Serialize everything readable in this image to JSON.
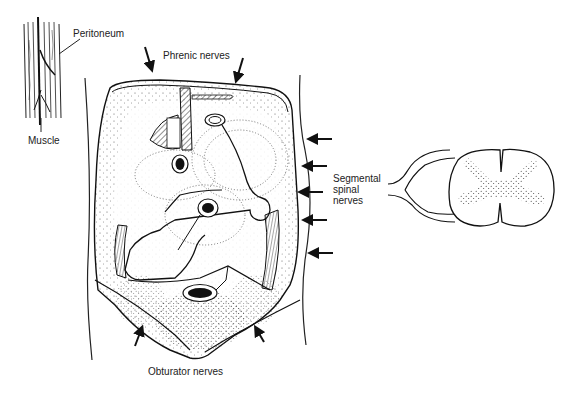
{
  "figure": {
    "labels": {
      "peritoneum": "Peritoneum",
      "muscle": "Muscle",
      "phrenic": "Phrenic nerves",
      "segmental_1": "Segmental",
      "segmental_2": "spinal",
      "segmental_3": "nerves",
      "obturator": "Obturator  nerves"
    },
    "panels": [
      {
        "name": "abdominal-wall-inset",
        "description": "Peritoneum and muscle layers"
      },
      {
        "name": "abdomen-diagram",
        "description": "Posterior abdominal wall with innervation regions"
      },
      {
        "name": "spinal-cord-section",
        "description": "Spinal cord cross-section with nerve roots"
      }
    ],
    "colors": {
      "ink": "#1a1a1a",
      "background": "#ffffff"
    }
  }
}
